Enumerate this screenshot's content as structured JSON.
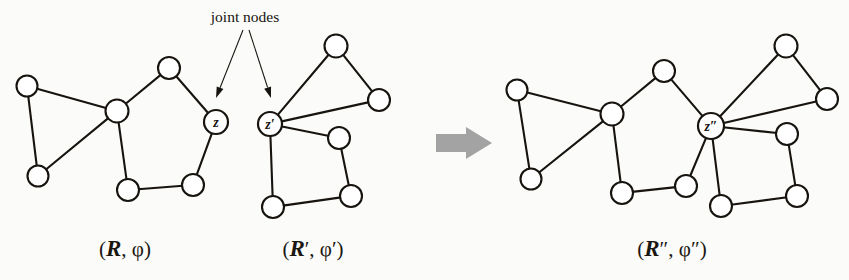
{
  "figure": {
    "background_color": "#fbfbf9",
    "ink_color": "#17140f",
    "merge_arrow_color": "#a3a3a3"
  },
  "annotation": {
    "label": "joint nodes",
    "label_x": 245,
    "label_y": 22,
    "arrows": [
      {
        "name": "arrow-to-z",
        "x1": 243,
        "y1": 30,
        "x2": 216,
        "y2": 98
      },
      {
        "name": "arrow-to-zprime",
        "x1": 249,
        "y1": 30,
        "x2": 271,
        "y2": 98
      }
    ]
  },
  "merge_arrow": {
    "name": "merge-arrow",
    "points": "436,134 466,134 466,127 492,143 466,159 466,152 436,152"
  },
  "graphs": [
    {
      "id": "R",
      "name": "graph-R",
      "caption": {
        "script": "R",
        "rest": ", φ",
        "full": "(R, φ)",
        "x": 125,
        "y": 256
      },
      "nodes": [
        {
          "id": "a1",
          "x": 27,
          "y": 86,
          "r": 10.5,
          "label": "",
          "joint": false
        },
        {
          "id": "a2",
          "x": 38,
          "y": 176,
          "r": 10.5,
          "label": "",
          "joint": false
        },
        {
          "id": "hub",
          "x": 117,
          "y": 111,
          "r": 11.5,
          "label": "",
          "joint": false
        },
        {
          "id": "top",
          "x": 169,
          "y": 68,
          "r": 11.0,
          "label": "",
          "joint": false
        },
        {
          "id": "bl",
          "x": 128,
          "y": 190,
          "r": 11.0,
          "label": "",
          "joint": false
        },
        {
          "id": "br",
          "x": 193,
          "y": 185,
          "r": 11.0,
          "label": "",
          "joint": false
        },
        {
          "id": "z",
          "x": 216,
          "y": 122,
          "r": 12.0,
          "label": "z",
          "joint": true
        }
      ],
      "edges": [
        [
          "a1",
          "a2"
        ],
        [
          "a1",
          "hub"
        ],
        [
          "a2",
          "hub"
        ],
        [
          "hub",
          "top"
        ],
        [
          "hub",
          "bl"
        ],
        [
          "top",
          "z"
        ],
        [
          "bl",
          "br"
        ],
        [
          "br",
          "z"
        ]
      ]
    },
    {
      "id": "Rprime",
      "name": "graph-R-prime",
      "caption": {
        "script": "R",
        "rest": "′, φ′",
        "full": "(R′, φ′)",
        "x": 313,
        "y": 256
      },
      "nodes": [
        {
          "id": "z2",
          "x": 270,
          "y": 124,
          "r": 12.0,
          "label": "z′",
          "joint": true
        },
        {
          "id": "t",
          "x": 336,
          "y": 46,
          "r": 11.5,
          "label": "",
          "joint": false
        },
        {
          "id": "rr",
          "x": 379,
          "y": 100,
          "r": 11.0,
          "label": "",
          "joint": false
        },
        {
          "id": "mr",
          "x": 339,
          "y": 138,
          "r": 11.0,
          "label": "",
          "joint": false
        },
        {
          "id": "br2",
          "x": 351,
          "y": 196,
          "r": 11.0,
          "label": "",
          "joint": false
        },
        {
          "id": "bl2",
          "x": 273,
          "y": 207,
          "r": 11.0,
          "label": "",
          "joint": false
        }
      ],
      "edges": [
        [
          "z2",
          "t"
        ],
        [
          "t",
          "rr"
        ],
        [
          "z2",
          "rr"
        ],
        [
          "z2",
          "mr"
        ],
        [
          "mr",
          "br2"
        ],
        [
          "z2",
          "bl2"
        ],
        [
          "bl2",
          "br2"
        ]
      ]
    },
    {
      "id": "Rdprime",
      "name": "graph-R-double-prime",
      "caption": {
        "script": "R",
        "rest": "″, φ″",
        "full": "(R″, φ″)",
        "x": 672,
        "y": 256
      },
      "nodes": [
        {
          "id": "b1",
          "x": 517,
          "y": 90,
          "r": 10.5,
          "label": "",
          "joint": false
        },
        {
          "id": "b2",
          "x": 531,
          "y": 179,
          "r": 10.5,
          "label": "",
          "joint": false
        },
        {
          "id": "hub2",
          "x": 612,
          "y": 114,
          "r": 11.5,
          "label": "",
          "joint": false
        },
        {
          "id": "top2",
          "x": 664,
          "y": 71,
          "r": 11.0,
          "label": "",
          "joint": false
        },
        {
          "id": "bl3",
          "x": 622,
          "y": 193,
          "r": 11.0,
          "label": "",
          "joint": false
        },
        {
          "id": "br3",
          "x": 686,
          "y": 186,
          "r": 11.0,
          "label": "",
          "joint": false
        },
        {
          "id": "zz",
          "x": 711,
          "y": 126,
          "r": 13.0,
          "label": "z″",
          "joint": true
        },
        {
          "id": "t2",
          "x": 786,
          "y": 46,
          "r": 11.5,
          "label": "",
          "joint": false
        },
        {
          "id": "rr2",
          "x": 827,
          "y": 99,
          "r": 11.0,
          "label": "",
          "joint": false
        },
        {
          "id": "mr2",
          "x": 787,
          "y": 134,
          "r": 11.0,
          "label": "",
          "joint": false
        },
        {
          "id": "brr",
          "x": 797,
          "y": 196,
          "r": 11.0,
          "label": "",
          "joint": false
        },
        {
          "id": "bll",
          "x": 721,
          "y": 206,
          "r": 11.0,
          "label": "",
          "joint": false
        }
      ],
      "edges": [
        [
          "b1",
          "b2"
        ],
        [
          "b1",
          "hub2"
        ],
        [
          "b2",
          "hub2"
        ],
        [
          "hub2",
          "top2"
        ],
        [
          "hub2",
          "bl3"
        ],
        [
          "top2",
          "zz"
        ],
        [
          "bl3",
          "br3"
        ],
        [
          "br3",
          "zz"
        ],
        [
          "zz",
          "t2"
        ],
        [
          "t2",
          "rr2"
        ],
        [
          "zz",
          "rr2"
        ],
        [
          "zz",
          "mr2"
        ],
        [
          "mr2",
          "brr"
        ],
        [
          "zz",
          "bll"
        ],
        [
          "bll",
          "brr"
        ]
      ]
    }
  ]
}
